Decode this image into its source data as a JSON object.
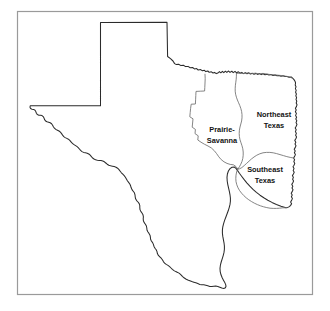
{
  "figure": {
    "background_color": "#ffffff",
    "frame_color": "#9a9a9a",
    "state_outline_color": "#2b2b2b",
    "region_outline_color": "#6f6f6f",
    "label_color": "#121212"
  },
  "state": {
    "name": "Texas"
  },
  "regions": [
    {
      "id": "prairie-savanna",
      "label_line_1": "Prairie-",
      "label_line_2": "Savanna",
      "label_x": 222,
      "label_y": 133
    },
    {
      "id": "northeast-texas",
      "label_line_1": "Northeast",
      "label_line_2": "Texas",
      "label_x": 274,
      "label_y": 118
    },
    {
      "id": "southeast-texas",
      "label_line_1": "Southeast",
      "label_line_2": "Texas",
      "label_x": 265,
      "label_y": 173
    }
  ]
}
